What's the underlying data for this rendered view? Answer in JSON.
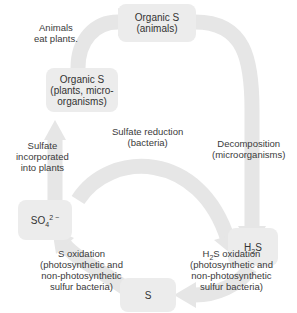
{
  "nodes": {
    "organic_animals": {
      "line1": "Organic S",
      "line2": "(animals)"
    },
    "organic_plants": {
      "line1": "Organic S",
      "line2": "(plants, micro-",
      "line3": "organisms)"
    },
    "sulfate": {
      "base": "SO",
      "sub": "4",
      "sup": "2 −"
    },
    "h2s": {
      "pre": "H",
      "sub": "2",
      "post": "S"
    },
    "sulfur": {
      "text": "S"
    }
  },
  "processes": {
    "animals_eat": {
      "line1": "Animals",
      "line2": "eat plants."
    },
    "sulfate_incorporated": {
      "line1": "Sulfate",
      "line2": "incorporated",
      "line3": "into plants"
    },
    "sulfate_reduction": {
      "line1": "Sulfate reduction",
      "line2": "(bacteria)"
    },
    "decomposition": {
      "line1": "Decomposition",
      "line2": "(microorganisms)"
    },
    "s_oxidation": {
      "line1": "S oxidation",
      "line2": "(photosynthetic and",
      "line3": "non-photosynthetic",
      "line4": "sulfur bacteria)"
    },
    "h2s_oxidation": {
      "pre": "H",
      "sub": "2",
      "post": "S oxidation",
      "line2": "(photosynthetic and",
      "line3": "non-photosynthetic",
      "line4": "sulfur bacteria)"
    }
  },
  "colors": {
    "arrow": "#e6e6e6",
    "box": "#ececec",
    "text": "#333333"
  }
}
